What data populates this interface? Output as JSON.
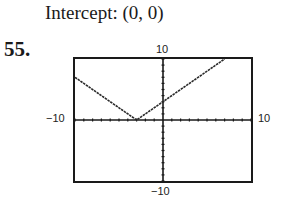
{
  "header": {
    "intercept_text": "Intercept:  (0, 0)"
  },
  "problem_number": "55.",
  "chart_data": {
    "type": "line",
    "title": "",
    "function": "y = |x + 3|",
    "x": [
      -10,
      -3,
      7
    ],
    "y": [
      7,
      0,
      10
    ],
    "xlim": [
      -10,
      10
    ],
    "ylim": [
      -10,
      10
    ],
    "xlabel": "",
    "ylabel": "",
    "tick_labels": {
      "xmin": "-10",
      "xmax": "10",
      "ymin": "-10",
      "ymax": "10"
    },
    "xscl": 1,
    "yscl": 1,
    "grid": false,
    "legend": null
  },
  "labels": {
    "ymax": "10",
    "ymin": "−10",
    "xmin": "−10",
    "xmax": "10"
  },
  "colors": {
    "ink": "#1a1a1a",
    "background": "#ffffff"
  }
}
